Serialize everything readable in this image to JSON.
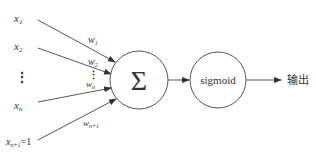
{
  "inputs": [
    {
      "base": "x",
      "sub": "1",
      "suffix": ""
    },
    {
      "base": "x",
      "sub": "2",
      "suffix": ""
    },
    {
      "base": "x",
      "sub": "n",
      "suffix": ""
    },
    {
      "base": "x",
      "sub": "n+1",
      "suffix": "=1"
    }
  ],
  "weights": [
    {
      "base": "w",
      "sub": "1"
    },
    {
      "base": "w",
      "sub": "2"
    },
    {
      "base": "w",
      "sub": "n"
    },
    {
      "base": "w",
      "sub": "n+1"
    }
  ],
  "ellipsis": "⋮",
  "sum_node": {
    "symbol": "Σ"
  },
  "activation_node": {
    "label": "sigmoid"
  },
  "output": {
    "label": "输出"
  },
  "colors": {
    "stroke": "#444444",
    "text": "#333333",
    "background": "#ffffff"
  }
}
